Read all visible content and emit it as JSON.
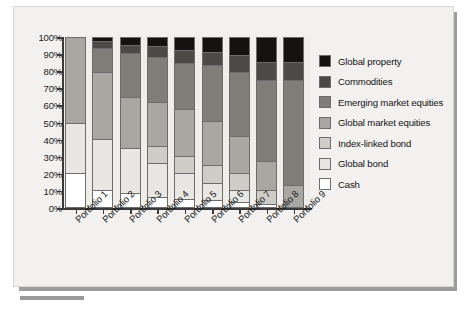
{
  "chart_data": {
    "type": "bar",
    "subtype": "stacked-100-percent-column",
    "title": "",
    "xlabel": "",
    "ylabel": "",
    "ylim": [
      0,
      100
    ],
    "ytick_labels": [
      "100%",
      "90%",
      "80%",
      "70%",
      "60%",
      "50%",
      "40%",
      "30%",
      "20%",
      "10%",
      "0%"
    ],
    "ytick_values": [
      100,
      90,
      80,
      70,
      60,
      50,
      40,
      30,
      20,
      10,
      0
    ],
    "grid": false,
    "legend_position": "right",
    "categories": [
      "Portfolio 1",
      "Portfolio 2",
      "Portfolio 3",
      "Portfolio 4",
      "Portfolio 5",
      "Portfolio 6",
      "Portfolio 7",
      "Portfolio 8",
      "Portfolio 9"
    ],
    "series": [
      {
        "name": "Cash",
        "color": "#ffffff",
        "values": [
          20,
          10,
          8,
          6,
          5,
          4,
          3,
          2,
          0
        ]
      },
      {
        "name": "Global bond",
        "color": "#e8e7e3",
        "values": [
          30,
          30,
          27,
          20,
          15,
          10,
          7,
          0,
          0
        ]
      },
      {
        "name": "Index-linked bond",
        "color": "#cfcdc8",
        "values": [
          0,
          0,
          0,
          10,
          10,
          11,
          10,
          8,
          0
        ]
      },
      {
        "name": "Global market equities",
        "color": "#a9a7a2",
        "values": [
          50,
          40,
          30,
          26,
          28,
          26,
          22,
          17,
          13
        ]
      },
      {
        "name": "Emerging market equities",
        "color": "#807e79",
        "values": [
          0,
          14,
          26,
          27,
          27,
          33,
          38,
          48,
          62
        ]
      },
      {
        "name": "Commodities",
        "color": "#4c4a46",
        "values": [
          0,
          4,
          5,
          6,
          8,
          8,
          10,
          11,
          11
        ]
      },
      {
        "name": "Global property",
        "color": "#141312",
        "values": [
          0,
          2,
          4,
          5,
          7,
          8,
          10,
          14,
          14
        ]
      }
    ]
  },
  "legend": {
    "items": [
      {
        "label": "Global property",
        "color": "#141312"
      },
      {
        "label": "Commodities",
        "color": "#4c4a46"
      },
      {
        "label": "Emerging market equities",
        "color": "#807e79"
      },
      {
        "label": "Global market equities",
        "color": "#a9a7a2"
      },
      {
        "label": "Index-linked bond",
        "color": "#cfcdc8"
      },
      {
        "label": "Global bond",
        "color": "#e8e7e3"
      },
      {
        "label": "Cash",
        "color": "#ffffff"
      }
    ]
  },
  "theme": {
    "page_background": "#ffffff",
    "panel_background": "#f2f1ef",
    "plot_background": "#efeeeb",
    "axis_color": "#3a3a3a",
    "text_color": "#1b1b1b",
    "shadow_color": "#9d9d9d"
  }
}
